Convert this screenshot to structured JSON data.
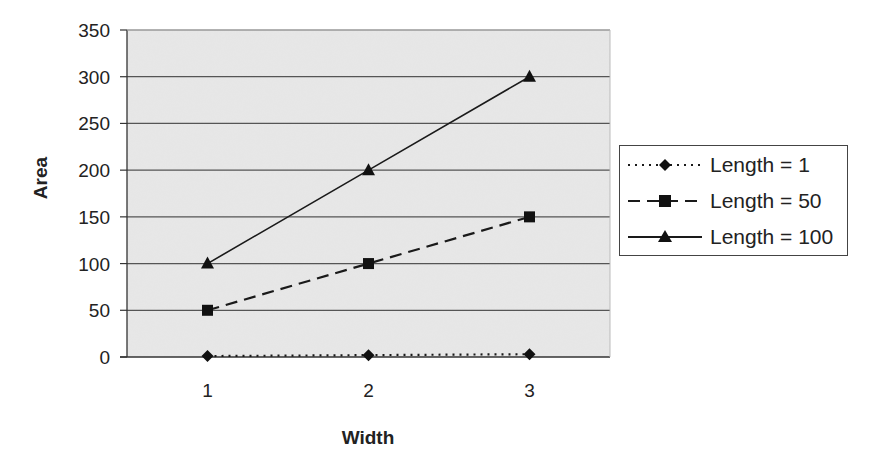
{
  "chart_data": {
    "type": "line",
    "title": "",
    "xlabel": "Width",
    "ylabel": "Area",
    "categories": [
      "1",
      "2",
      "3"
    ],
    "x": [
      1,
      2,
      3
    ],
    "series": [
      {
        "name": "Length = 1",
        "values": [
          1,
          2,
          3
        ],
        "marker": "diamond",
        "line_style": "dotted"
      },
      {
        "name": "Length = 50",
        "values": [
          50,
          100,
          150
        ],
        "marker": "square",
        "line_style": "dashed"
      },
      {
        "name": "Length = 100",
        "values": [
          100,
          200,
          300
        ],
        "marker": "triangle",
        "line_style": "solid"
      }
    ],
    "ylim": [
      0,
      350
    ],
    "yticks": [
      0,
      50,
      100,
      150,
      200,
      250,
      300,
      350
    ],
    "grid": "horizontal",
    "legend_position": "right",
    "plot_background": "#e6e6e6"
  },
  "colors": {
    "plot_bg": "#e6e6e6",
    "gridline": "#555555",
    "series": "#1a1a1a"
  }
}
